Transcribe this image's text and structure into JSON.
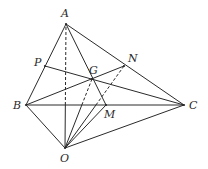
{
  "diagram": {
    "type": "geometry-tetrahedron",
    "stroke_color": "#2a2a2a",
    "background": "#ffffff",
    "points": {
      "A": {
        "x": 66,
        "y": 24,
        "label": "A",
        "lx": 61,
        "ly": 17
      },
      "B": {
        "x": 26,
        "y": 105,
        "label": "B",
        "lx": 13,
        "ly": 109
      },
      "C": {
        "x": 184,
        "y": 105,
        "label": "C",
        "lx": 189,
        "ly": 109
      },
      "O": {
        "x": 65,
        "y": 148,
        "label": "O",
        "lx": 60,
        "ly": 162
      },
      "P": {
        "x": 45,
        "y": 66,
        "label": "P",
        "lx": 34,
        "ly": 66
      },
      "N": {
        "x": 124,
        "y": 66,
        "label": "N",
        "lx": 128,
        "ly": 62
      },
      "G": {
        "x": 92,
        "y": 79,
        "label": "G",
        "lx": 89,
        "ly": 74
      },
      "M": {
        "x": 106,
        "y": 105,
        "label": "M",
        "lx": 104,
        "ly": 118
      }
    },
    "solid_segments": [
      [
        "A",
        "B"
      ],
      [
        "A",
        "C"
      ],
      [
        "B",
        "C"
      ],
      [
        "B",
        "O"
      ],
      [
        "C",
        "O"
      ],
      [
        "A",
        "M"
      ],
      [
        "B",
        "N"
      ],
      [
        "C",
        "P"
      ],
      [
        "O",
        "M"
      ]
    ],
    "mixed_segments": [
      {
        "from": "O",
        "to": "A",
        "note": "solid below BC, dashed above"
      },
      {
        "from": "O",
        "to": "G",
        "note": "solid below BC, dashed above"
      },
      {
        "from": "O",
        "to": "N",
        "note": "solid below BC, dashed above"
      }
    ],
    "labels": [
      "A",
      "B",
      "C",
      "O",
      "P",
      "N",
      "G",
      "M"
    ]
  }
}
